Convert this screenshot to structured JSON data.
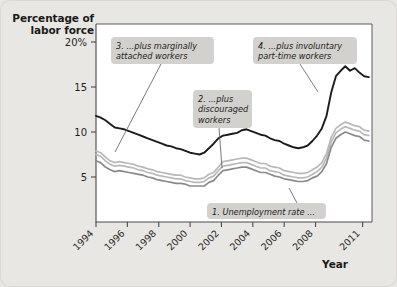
{
  "figure": {
    "y_axis_title_line1": "Percentage of",
    "y_axis_title_line2": "labor force",
    "x_axis_title": "Year"
  },
  "chart_data": {
    "type": "line",
    "title": "",
    "xlabel": "Year",
    "ylabel": "Percentage of labor force",
    "xlim": [
      1994,
      2011.6
    ],
    "ylim": [
      0,
      22
    ],
    "yticks": [
      5,
      10,
      15,
      20
    ],
    "ytick_labels": [
      "5",
      "10",
      "15",
      "20%"
    ],
    "xticks": [
      1994,
      1996,
      1998,
      2000,
      2002,
      2004,
      2006,
      2008,
      2011
    ],
    "xtick_labels": [
      "1994",
      "1996",
      "1998",
      "2000",
      "2002",
      "2004",
      "2006",
      "2008",
      "2011"
    ],
    "grid": false,
    "legend": "annotations",
    "colors": {
      "u6": "#1c1c1c",
      "u5": "#b9b9b9",
      "u4": "#8a8a8a",
      "plot_background": "#ffffff",
      "figure_background": "#e9e7e3",
      "callout_background": "#d3d1cd",
      "axis": "#4a4a4a"
    },
    "series": [
      {
        "name": "1. Unemployment rate",
        "key": "u3",
        "color": "#8a8a8a",
        "x": [
          1994.0,
          1994.3,
          1994.6,
          1994.9,
          1995.2,
          1995.5,
          1995.8,
          1996.1,
          1996.4,
          1996.7,
          1997.0,
          1997.3,
          1997.6,
          1997.9,
          1998.2,
          1998.5,
          1998.8,
          1999.1,
          1999.4,
          1999.7,
          2000.0,
          2000.3,
          2000.6,
          2000.9,
          2001.2,
          2001.5,
          2001.8,
          2002.1,
          2002.4,
          2002.7,
          2003.0,
          2003.3,
          2003.6,
          2003.9,
          2004.2,
          2004.5,
          2004.8,
          2005.1,
          2005.4,
          2005.7,
          2006.0,
          2006.3,
          2006.6,
          2006.9,
          2007.2,
          2007.5,
          2007.8,
          2008.1,
          2008.4,
          2008.7,
          2009.0,
          2009.3,
          2009.6,
          2009.9,
          2010.2,
          2010.5,
          2010.8,
          2011.1,
          2011.4
        ],
        "y": [
          6.8,
          6.6,
          6.1,
          5.8,
          5.6,
          5.7,
          5.6,
          5.5,
          5.4,
          5.3,
          5.2,
          5.0,
          4.9,
          4.7,
          4.6,
          4.5,
          4.4,
          4.3,
          4.3,
          4.2,
          4.0,
          4.0,
          4.0,
          4.0,
          4.4,
          4.6,
          5.2,
          5.7,
          5.8,
          5.9,
          6.0,
          6.1,
          6.1,
          5.9,
          5.7,
          5.5,
          5.5,
          5.3,
          5.1,
          5.0,
          4.8,
          4.7,
          4.6,
          4.5,
          4.5,
          4.6,
          4.9,
          5.1,
          5.6,
          6.5,
          8.3,
          9.3,
          9.7,
          10.0,
          9.8,
          9.6,
          9.5,
          9.1,
          9.0
        ]
      },
      {
        "name": "2. plus discouraged workers",
        "key": "u4",
        "color": "#b9b9b9",
        "x": [
          1994.0,
          1994.3,
          1994.6,
          1994.9,
          1995.2,
          1995.5,
          1995.8,
          1996.1,
          1996.4,
          1996.7,
          1997.0,
          1997.3,
          1997.6,
          1997.9,
          1998.2,
          1998.5,
          1998.8,
          1999.1,
          1999.4,
          1999.7,
          2000.0,
          2000.3,
          2000.6,
          2000.9,
          2001.2,
          2001.5,
          2001.8,
          2002.1,
          2002.4,
          2002.7,
          2003.0,
          2003.3,
          2003.6,
          2003.9,
          2004.2,
          2004.5,
          2004.8,
          2005.1,
          2005.4,
          2005.7,
          2006.0,
          2006.3,
          2006.6,
          2006.9,
          2007.2,
          2007.5,
          2007.8,
          2008.1,
          2008.4,
          2008.7,
          2009.0,
          2009.3,
          2009.6,
          2009.9,
          2010.2,
          2010.5,
          2010.8,
          2011.1,
          2011.4
        ],
        "y": [
          7.5,
          7.3,
          6.8,
          6.4,
          6.2,
          6.3,
          6.2,
          6.1,
          6.0,
          5.8,
          5.7,
          5.5,
          5.4,
          5.2,
          5.1,
          5.0,
          4.9,
          4.8,
          4.8,
          4.6,
          4.5,
          4.4,
          4.4,
          4.5,
          4.9,
          5.1,
          5.7,
          6.2,
          6.3,
          6.4,
          6.5,
          6.6,
          6.6,
          6.4,
          6.2,
          6.0,
          6.0,
          5.7,
          5.6,
          5.5,
          5.2,
          5.1,
          5.0,
          4.9,
          4.9,
          5.0,
          5.3,
          5.6,
          6.1,
          7.1,
          8.9,
          9.9,
          10.3,
          10.6,
          10.4,
          10.2,
          10.1,
          9.7,
          9.6
        ]
      },
      {
        "name": "3. plus marginally attached workers",
        "key": "u5",
        "color": "#b9b9b9",
        "x": [
          1994.0,
          1994.3,
          1994.6,
          1994.9,
          1995.2,
          1995.5,
          1995.8,
          1996.1,
          1996.4,
          1996.7,
          1997.0,
          1997.3,
          1997.6,
          1997.9,
          1998.2,
          1998.5,
          1998.8,
          1999.1,
          1999.4,
          1999.7,
          2000.0,
          2000.3,
          2000.6,
          2000.9,
          2001.2,
          2001.5,
          2001.8,
          2002.1,
          2002.4,
          2002.7,
          2003.0,
          2003.3,
          2003.6,
          2003.9,
          2004.2,
          2004.5,
          2004.8,
          2005.1,
          2005.4,
          2005.7,
          2006.0,
          2006.3,
          2006.6,
          2006.9,
          2007.2,
          2007.5,
          2007.8,
          2008.1,
          2008.4,
          2008.7,
          2009.0,
          2009.3,
          2009.6,
          2009.9,
          2010.2,
          2010.5,
          2010.8,
          2011.1,
          2011.4
        ],
        "y": [
          7.9,
          7.7,
          7.2,
          6.8,
          6.6,
          6.7,
          6.6,
          6.5,
          6.4,
          6.2,
          6.1,
          5.9,
          5.8,
          5.6,
          5.5,
          5.4,
          5.3,
          5.2,
          5.2,
          5.0,
          4.9,
          4.8,
          4.8,
          4.9,
          5.3,
          5.5,
          6.1,
          6.7,
          6.8,
          6.9,
          7.0,
          7.1,
          7.1,
          6.9,
          6.7,
          6.5,
          6.5,
          6.2,
          6.1,
          6.0,
          5.7,
          5.6,
          5.5,
          5.4,
          5.4,
          5.5,
          5.8,
          6.1,
          6.6,
          7.6,
          9.4,
          10.4,
          10.8,
          11.1,
          10.9,
          10.7,
          10.6,
          10.2,
          10.1
        ]
      },
      {
        "name": "4. plus involuntary part-time workers",
        "key": "u6",
        "color": "#1c1c1c",
        "x": [
          1994.0,
          1994.3,
          1994.6,
          1994.9,
          1995.2,
          1995.5,
          1995.8,
          1996.1,
          1996.4,
          1996.7,
          1997.0,
          1997.3,
          1997.6,
          1997.9,
          1998.2,
          1998.5,
          1998.8,
          1999.1,
          1999.4,
          1999.7,
          2000.0,
          2000.3,
          2000.6,
          2000.9,
          2001.2,
          2001.5,
          2001.8,
          2002.1,
          2002.4,
          2002.7,
          2003.0,
          2003.3,
          2003.6,
          2003.9,
          2004.2,
          2004.5,
          2004.8,
          2005.1,
          2005.4,
          2005.7,
          2006.0,
          2006.3,
          2006.6,
          2006.9,
          2007.2,
          2007.5,
          2007.8,
          2008.1,
          2008.4,
          2008.7,
          2009.0,
          2009.3,
          2009.6,
          2009.9,
          2010.2,
          2010.5,
          2010.8,
          2011.1,
          2011.4
        ],
        "y": [
          11.8,
          11.6,
          11.3,
          10.9,
          10.5,
          10.4,
          10.3,
          10.1,
          9.9,
          9.7,
          9.5,
          9.3,
          9.1,
          8.9,
          8.7,
          8.5,
          8.4,
          8.2,
          8.1,
          7.9,
          7.7,
          7.6,
          7.5,
          7.7,
          8.2,
          8.7,
          9.3,
          9.6,
          9.7,
          9.8,
          9.9,
          10.2,
          10.3,
          10.1,
          9.9,
          9.7,
          9.6,
          9.3,
          9.1,
          9.0,
          8.7,
          8.5,
          8.3,
          8.2,
          8.3,
          8.5,
          9.0,
          9.6,
          10.4,
          11.8,
          14.4,
          16.2,
          16.8,
          17.3,
          16.8,
          17.1,
          16.6,
          16.2,
          16.1
        ]
      }
    ],
    "annotations": [
      {
        "id": "callout-3",
        "number": "3.",
        "lines": [
          "3. ...plus marginally",
          "attached workers"
        ],
        "box": {
          "x": 111,
          "y": 37,
          "w": 103,
          "h": 27
        },
        "leader": {
          "x1": 161,
          "y1": 64,
          "x2": 115,
          "y2": 152
        }
      },
      {
        "id": "callout-4",
        "number": "4.",
        "lines": [
          "4. ...plus involuntary",
          "part-time workers"
        ],
        "box": {
          "x": 253,
          "y": 37,
          "w": 104,
          "h": 27
        },
        "leader": {
          "x1": 300,
          "y1": 64,
          "x2": 318,
          "y2": 92
        }
      },
      {
        "id": "callout-2",
        "number": "2.",
        "lines": [
          "2. ...plus",
          "discouraged",
          "workers"
        ],
        "box": {
          "x": 193,
          "y": 90,
          "w": 59,
          "h": 38
        },
        "leader": {
          "x1": 219,
          "y1": 128,
          "x2": 222,
          "y2": 168
        }
      },
      {
        "id": "callout-1",
        "number": "1.",
        "lines": [
          "1. Unemployment rate ..."
        ],
        "box": {
          "x": 207,
          "y": 203,
          "w": 119,
          "h": 16
        },
        "leader": {
          "x1": 297,
          "y1": 203,
          "x2": 289,
          "y2": 188
        }
      }
    ]
  }
}
